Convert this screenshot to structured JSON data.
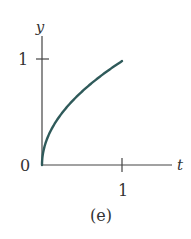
{
  "chart_data": {
    "type": "line",
    "title": "",
    "caption": "(e)",
    "xlabel": "t",
    "ylabel": "y",
    "xlim": [
      0,
      1.25
    ],
    "ylim": [
      0,
      1.1
    ],
    "x_ticks": [
      {
        "value": 1,
        "label": "1"
      }
    ],
    "y_ticks": [
      {
        "value": 0,
        "label": "0"
      },
      {
        "value": 1,
        "label": "1"
      }
    ],
    "grid": false,
    "legend": null,
    "series": [
      {
        "name": "y = sqrt(t)",
        "color": "#2f5a5a",
        "x": [
          0,
          0.01,
          0.05,
          0.1,
          0.2,
          0.3,
          0.4,
          0.5,
          0.6,
          0.7,
          0.8,
          0.9,
          1.0
        ],
        "values": [
          0,
          0.1,
          0.224,
          0.316,
          0.447,
          0.548,
          0.632,
          0.707,
          0.775,
          0.837,
          0.894,
          0.949,
          1.0
        ]
      }
    ]
  },
  "colors": {
    "axis": "#444444",
    "curve": "#2f5a5a",
    "text": "#333333"
  }
}
